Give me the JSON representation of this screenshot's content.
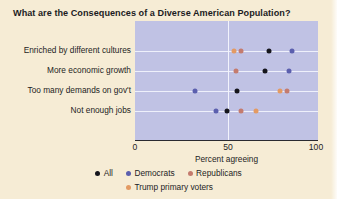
{
  "chart_data": {
    "type": "scatter",
    "title": "What are the Consequences of a Diverse American Population?",
    "xlabel": "Percent agreeing",
    "ylabel": "",
    "xlim": [
      0,
      100
    ],
    "xticks": [
      0,
      50,
      100
    ],
    "xtick_labels": [
      "0",
      "50",
      "100"
    ],
    "grid": true,
    "legend_position": "bottom",
    "categories": [
      "Enriched by different cultures",
      "More economic growth",
      "Too many demands on gov't",
      "Not enough jobs"
    ],
    "series": [
      {
        "name": "All",
        "color": "#15151c",
        "values": [
          73,
          71,
          56,
          50
        ]
      },
      {
        "name": "Democrats",
        "color": "#5b5fae",
        "values": [
          86,
          84,
          33,
          44
        ]
      },
      {
        "name": "Republicans",
        "color": "#c47b6e",
        "values": [
          58,
          55,
          83,
          58
        ]
      },
      {
        "name": "Trump primary voters",
        "color": "#e39a63",
        "values": [
          54,
          null,
          79,
          66
        ]
      }
    ]
  },
  "legend": {
    "row1": [
      {
        "label": "All",
        "color": "#15151c"
      },
      {
        "label": "Democrats",
        "color": "#5b5fae"
      },
      {
        "label": "Republicans",
        "color": "#c47b6e"
      }
    ],
    "row2": [
      {
        "label": "Trump primary voters",
        "color": "#e39a63"
      }
    ]
  },
  "colors": {
    "page_background": "#f6ecd5",
    "plot_background": "#c0c2e4",
    "gridline": "#eef0fb",
    "axis": "#2a2a30",
    "text": "#1d1d24"
  }
}
